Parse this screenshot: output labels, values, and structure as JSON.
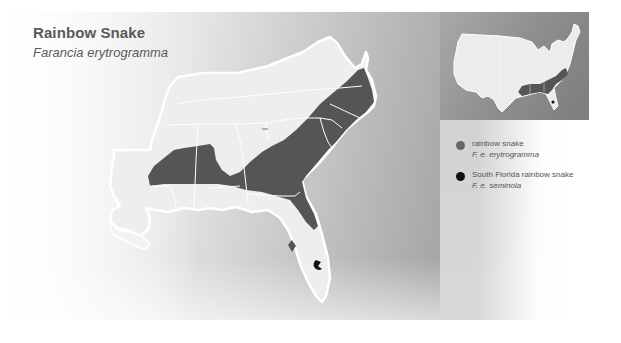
{
  "header": {
    "title": "Rainbow Snake",
    "scientific_name": "Farancia erytrogramma"
  },
  "legend": {
    "items": [
      {
        "label": "rainbow snake",
        "scientific_name": "F. e. erytrogramma",
        "color": "#666666"
      },
      {
        "label": "South Florida rainbow snake",
        "scientific_name": "F. e. seminola",
        "color": "#111111"
      }
    ]
  },
  "map": {
    "land_color": "#eeeeee",
    "border_color": "#ffffff",
    "range_color": "#555555",
    "seminola_color": "#111111",
    "inset": {
      "description": "United States overview with southeastern range highlighted"
    }
  },
  "colors": {
    "panel_gray": "#a4a4a4",
    "inset_gray": "#8f8f8f",
    "text": "#5a5a5a"
  }
}
